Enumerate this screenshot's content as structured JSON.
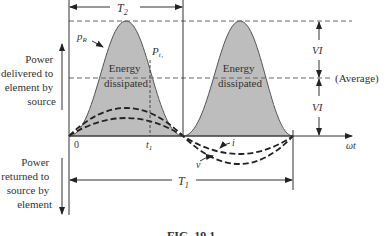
{
  "figure": {
    "caption": "FIG. 19.1",
    "labels": {
      "power_delivered": [
        "Power",
        "delivered to",
        "element by",
        "source"
      ],
      "power_returned": [
        "Power",
        "returned to",
        "source by",
        "element"
      ],
      "energy_1": [
        "Energy",
        "dissipated"
      ],
      "energy_2": [
        "Energy",
        "dissipated"
      ],
      "pR": "p",
      "pR_sub": "R",
      "pt1": "P",
      "pt1_sub": "t₁",
      "T2": "T",
      "T2_sub": "2",
      "T1": "T",
      "T1_sub": "1",
      "origin": "0",
      "t1": "t",
      "t1_sub": "1",
      "omega_t": "ωt",
      "i": "i",
      "v": "v",
      "VI_top": "VI",
      "VI_bottom": "VI",
      "average": "(Average)"
    },
    "colors": {
      "fill": "#bdbdbd",
      "line": "#333333",
      "dash": "#555555"
    }
  }
}
